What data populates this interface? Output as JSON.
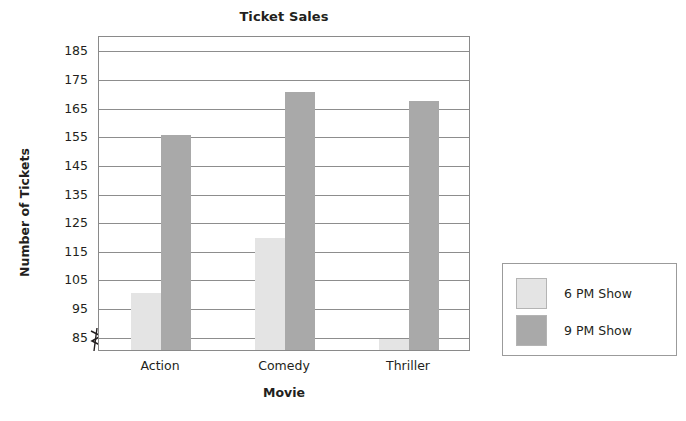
{
  "chart_data": {
    "type": "bar",
    "title": "Ticket Sales",
    "xlabel": "Movie",
    "ylabel": "Number of Tickets",
    "categories": [
      "Action",
      "Comedy",
      "Thriller"
    ],
    "series": [
      {
        "name": "6 PM Show",
        "values": [
          100,
          119,
          84
        ],
        "color": "#e4e4e4"
      },
      {
        "name": "9 PM Show",
        "values": [
          155,
          170,
          167
        ],
        "color": "#a9a9a9"
      }
    ],
    "ylim": [
      80,
      190
    ],
    "yticks": [
      85,
      95,
      105,
      115,
      125,
      135,
      145,
      155,
      165,
      175,
      185
    ],
    "ytick_labels": [
      "85",
      "95",
      "105",
      "115",
      "125",
      "135",
      "145",
      "155",
      "165",
      "175",
      "185"
    ],
    "grid": true,
    "axis_break": true,
    "legend_position": "right-outside"
  },
  "legend": {
    "entries": [
      {
        "label": "6 PM Show",
        "color": "#e4e4e4"
      },
      {
        "label": "9 PM Show",
        "color": "#a9a9a9"
      }
    ]
  },
  "icons": {
    "axis_break": "axis-break-zigzag-icon"
  }
}
